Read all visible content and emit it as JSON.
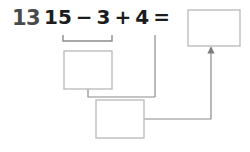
{
  "worksheet": {
    "problem_number": "13",
    "equation": {
      "operand_1": "15",
      "operator_1": "−",
      "operand_2": "3",
      "operator_2": "+",
      "operand_3": "4",
      "equals": "=",
      "full_text": "15 − 3 + 4 ="
    },
    "answer_box": {
      "label": "answer-box",
      "value": ""
    },
    "work_box_1": {
      "label": "partial-sum-box",
      "value": ""
    },
    "work_box_2": {
      "label": "final-step-box",
      "value": ""
    },
    "bracket": {
      "label": "grouping-bracket-under-15-minus-3"
    },
    "colors": {
      "ink": "#1c1c1c",
      "number_ink": "#4a4a4a",
      "box_border": "#b8b8b8",
      "connector": "#8c8c8c",
      "background": "#ffffff"
    }
  }
}
